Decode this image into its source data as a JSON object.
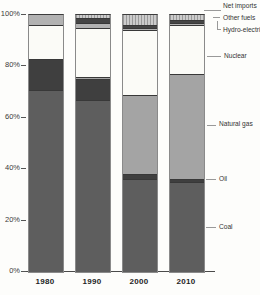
{
  "figure": {
    "y_axis_ticks": [
      "100%",
      "80%",
      "60%",
      "40%",
      "20%",
      "0%"
    ],
    "x_labels": [
      "1980",
      "1990",
      "2000",
      "2010"
    ],
    "legend": {
      "items": [
        "Net imports",
        "Other fuels",
        "Hydro-electric",
        "Nuclear",
        "Natural gas",
        "Oil",
        "Coal"
      ]
    }
  },
  "chart_data": {
    "type": "bar",
    "stacked": true,
    "unit": "%",
    "title": "",
    "xlabel": "",
    "ylabel": "",
    "ylim": [
      0,
      100
    ],
    "grid": false,
    "legend_position": "right",
    "categories": [
      "1980",
      "1990",
      "2000",
      "2010"
    ],
    "series": [
      {
        "name": "Net imports",
        "values": [
          0,
          1,
          4,
          2
        ],
        "color": "#cccccc",
        "pattern": "hatch"
      },
      {
        "name": "Other fuels",
        "values": [
          0,
          2,
          1,
          1
        ],
        "color": "#454545",
        "pattern": "solid"
      },
      {
        "name": "Hydro-electric",
        "values": [
          4,
          2,
          1,
          1
        ],
        "color": "#b2b2b2",
        "pattern": "solid"
      },
      {
        "name": "Nuclear",
        "values": [
          13,
          19,
          25,
          19
        ],
        "color": "#fbfbf7",
        "pattern": "solid"
      },
      {
        "name": "Natural gas",
        "values": [
          0,
          1,
          31,
          41
        ],
        "color": "#a4a4a4",
        "pattern": "solid"
      },
      {
        "name": "Oil",
        "values": [
          12,
          8,
          2,
          1
        ],
        "color": "#3f3f3f",
        "pattern": "solid"
      },
      {
        "name": "Coal",
        "values": [
          71,
          67,
          36,
          35
        ],
        "color": "#5e5e5e",
        "pattern": "texture"
      }
    ]
  }
}
